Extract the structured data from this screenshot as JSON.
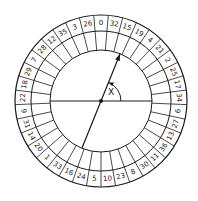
{
  "diagram": {
    "center": [
      101,
      101
    ],
    "radii": {
      "outer": 86,
      "number_ring_inner": 70,
      "inner_ring_inner": 51
    },
    "pockets": [
      0,
      32,
      15,
      19,
      4,
      21,
      2,
      25,
      17,
      34,
      6,
      27,
      13,
      36,
      11,
      30,
      8,
      23,
      10,
      5,
      24,
      16,
      33,
      1,
      20,
      14,
      31,
      9,
      22,
      18,
      29,
      7,
      28,
      12,
      35,
      3,
      26
    ],
    "pocket_order": "clockwise starting at top",
    "reference_line": "horizontal diameter",
    "pointer": {
      "type": "arrow",
      "angle_deg_from_horizontal": 68,
      "direction": "upper-right"
    },
    "angle_label": "X",
    "line_color": "#1a1a1a"
  }
}
